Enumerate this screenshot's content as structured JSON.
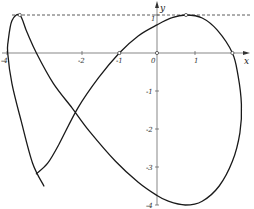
{
  "chart_data": {
    "type": "line",
    "title": "",
    "xlabel": "x",
    "ylabel": "y",
    "xlim": [
      -4.1,
      2.5
    ],
    "ylim": [
      -4.05,
      1.3
    ],
    "grid": false,
    "legend": null,
    "x_ticks": [
      {
        "value": -4,
        "label": "-4"
      },
      {
        "value": -2,
        "label": "-2"
      },
      {
        "value": -1,
        "label": "-1"
      },
      {
        "value": 0,
        "label": "0"
      },
      {
        "value": 1,
        "label": "1"
      }
    ],
    "y_ticks": [
      {
        "value": 1,
        "label": "1"
      },
      {
        "value": -1,
        "label": "-1"
      },
      {
        "value": -2,
        "label": "-2"
      },
      {
        "value": -3,
        "label": "-3"
      },
      {
        "value": -4,
        "label": "-4"
      }
    ],
    "reference_lines": [
      {
        "type": "horizontal",
        "y": 1,
        "style": "dashed"
      }
    ],
    "marked_points": [
      {
        "x": -3.64,
        "y": 1.0
      },
      {
        "x": -1.0,
        "y": 0.0
      },
      {
        "x": 0.0,
        "y": 0.0
      },
      {
        "x": 0.77,
        "y": 1.0
      },
      {
        "x": 2.0,
        "y": 0.0
      }
    ],
    "series": [
      {
        "name": "parametric curve",
        "points": [
          [
            -3.2,
            -3.18
          ],
          [
            -2.9,
            -2.9
          ],
          [
            -2.6,
            -2.4
          ],
          [
            -2.1,
            -1.45
          ],
          [
            -1.55,
            -0.65
          ],
          [
            -1.0,
            0.0
          ],
          [
            -0.5,
            0.45
          ],
          [
            0.0,
            0.74
          ],
          [
            0.4,
            0.93
          ],
          [
            0.77,
            1.0
          ],
          [
            1.2,
            0.92
          ],
          [
            1.6,
            0.6
          ],
          [
            2.0,
            0.0
          ],
          [
            2.15,
            -0.6
          ],
          [
            2.24,
            -1.35
          ],
          [
            2.2,
            -2.1
          ],
          [
            2.0,
            -2.85
          ],
          [
            1.65,
            -3.5
          ],
          [
            1.2,
            -3.9
          ],
          [
            0.75,
            -4.0
          ],
          [
            0.3,
            -3.9
          ],
          [
            0.0,
            -3.75
          ],
          [
            -0.5,
            -3.4
          ],
          [
            -1.1,
            -2.85
          ],
          [
            -1.8,
            -2.05
          ],
          [
            -2.25,
            -1.45
          ],
          [
            -2.75,
            -0.8
          ],
          [
            -3.2,
            0.0
          ],
          [
            -3.45,
            0.55
          ],
          [
            -3.64,
            1.0
          ],
          [
            -3.85,
            0.85
          ],
          [
            -3.95,
            0.3
          ],
          [
            -3.96,
            0.0
          ],
          [
            -3.85,
            -0.8
          ],
          [
            -3.6,
            -1.8
          ],
          [
            -3.3,
            -2.9
          ],
          [
            -3.0,
            -3.5
          ]
        ]
      }
    ]
  },
  "labels": {
    "x_axis": "x",
    "y_axis": "y",
    "origin": "0",
    "xt_m4": "-4",
    "xt_m2": "-2",
    "xt_m1": "-1",
    "xt_1": "1",
    "yt_1": "1",
    "yt_m1": "-1",
    "yt_m2": "-2",
    "yt_m3": "-3",
    "yt_m4": "-4"
  }
}
